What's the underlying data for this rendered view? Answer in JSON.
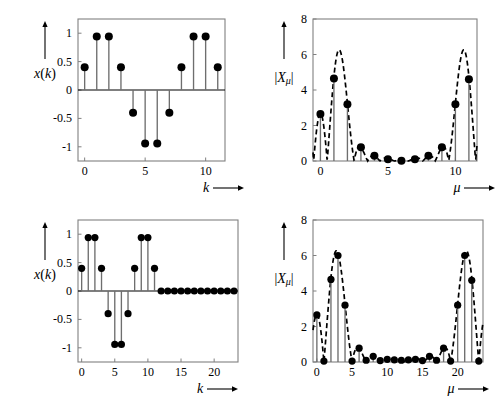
{
  "figure": {
    "background": "#ffffff",
    "ink": "#000000",
    "stem_color": "#6e6e6e",
    "frame_color": "#808080"
  },
  "panels": [
    {
      "id": "top-left",
      "name": "signal-12-point",
      "ylabel": "x(k)",
      "xlabel": "k",
      "xlabel_arrow": "⟶",
      "yticks": [
        "1",
        "0.5",
        "0",
        "-0.5",
        "-1"
      ],
      "ytickvals": [
        1,
        0.5,
        0,
        -0.5,
        -1
      ],
      "xticks": [
        "0",
        "5",
        "10"
      ],
      "xtickvals": [
        0,
        5,
        10
      ]
    },
    {
      "id": "top-right",
      "name": "dft-12-point",
      "ylabel": "|Xμ|",
      "xlabel": "μ",
      "xlabel_arrow": "⟶",
      "yticks": [
        "8",
        "6",
        "4",
        "2",
        "0"
      ],
      "ytickvals": [
        8,
        6,
        4,
        2,
        0
      ],
      "xticks": [
        "0",
        "5",
        "10"
      ],
      "xtickvals": [
        0,
        5,
        10
      ]
    },
    {
      "id": "bottom-left",
      "name": "signal-24-point-zero-padded",
      "ylabel": "x(k)",
      "xlabel": "k",
      "xlabel_arrow": "⟶",
      "yticks": [
        "1",
        "0.5",
        "0",
        "-0.5",
        "-1"
      ],
      "ytickvals": [
        1,
        0.5,
        0,
        -0.5,
        -1
      ],
      "xticks": [
        "0",
        "5",
        "10",
        "15",
        "20"
      ],
      "xtickvals": [
        0,
        5,
        10,
        15,
        20
      ]
    },
    {
      "id": "bottom-right",
      "name": "dft-24-point-zero-padded",
      "ylabel": "|Xμ|",
      "xlabel": "μ",
      "xlabel_arrow": "⟶",
      "yticks": [
        "8",
        "6",
        "4",
        "2",
        "0"
      ],
      "ytickvals": [
        8,
        6,
        4,
        2,
        0
      ],
      "xticks": [
        "0",
        "5",
        "10",
        "15",
        "20"
      ],
      "xtickvals": [
        0,
        5,
        10,
        15,
        20
      ]
    }
  ],
  "chart_data": [
    {
      "type": "line",
      "subtype": "stem",
      "id": "top-left",
      "title": "",
      "xlabel": "k",
      "ylabel": "x(k)",
      "xlim": [
        -0.55,
        11.6
      ],
      "ylim": [
        -1.25,
        1.25
      ],
      "grid": false,
      "legend": null,
      "x": [
        0,
        1,
        2,
        3,
        4,
        5,
        6,
        7,
        8,
        9,
        10,
        11
      ],
      "values": [
        0.4,
        0.94,
        0.94,
        0.4,
        -0.4,
        -0.94,
        -0.94,
        -0.4,
        0.4,
        0.94,
        0.94,
        0.4
      ]
    },
    {
      "type": "line",
      "subtype": "stem-with-dashed-envelope",
      "id": "top-right",
      "title": "",
      "xlabel": "μ",
      "ylabel": "|Xμ|",
      "xlim": [
        -0.55,
        11.6
      ],
      "ylim": [
        0,
        8
      ],
      "grid": false,
      "legend": null,
      "x": [
        0,
        1,
        2,
        3,
        4,
        5,
        6,
        7,
        8,
        9,
        10,
        11
      ],
      "values": [
        2.65,
        4.65,
        3.2,
        0.78,
        0.3,
        0.1,
        0.02,
        0.1,
        0.3,
        0.78,
        3.2,
        4.6
      ],
      "envelope_note": "dashed continuous DTFT magnitude envelope peaking near 6 at μ≈1.3 and μ≈10.7"
    },
    {
      "type": "line",
      "subtype": "stem",
      "id": "bottom-left",
      "title": "",
      "xlabel": "k",
      "ylabel": "x(k)",
      "xlim": [
        -0.55,
        23.6
      ],
      "ylim": [
        -1.25,
        1.25
      ],
      "grid": false,
      "legend": null,
      "x": [
        0,
        1,
        2,
        3,
        4,
        5,
        6,
        7,
        8,
        9,
        10,
        11,
        12,
        13,
        14,
        15,
        16,
        17,
        18,
        19,
        20,
        21,
        22,
        23
      ],
      "values": [
        0.4,
        0.94,
        0.94,
        0.4,
        -0.4,
        -0.94,
        -0.94,
        -0.4,
        0.4,
        0.94,
        0.94,
        0.4,
        0,
        0,
        0,
        0,
        0,
        0,
        0,
        0,
        0,
        0,
        0,
        0
      ]
    },
    {
      "type": "line",
      "subtype": "stem-with-dashed-envelope",
      "id": "bottom-right",
      "title": "",
      "xlabel": "μ",
      "ylabel": "|Xμ|",
      "xlim": [
        -0.55,
        23.6
      ],
      "ylim": [
        0,
        8
      ],
      "grid": false,
      "legend": null,
      "x": [
        0,
        1,
        2,
        3,
        4,
        5,
        6,
        7,
        8,
        9,
        10,
        11,
        12,
        13,
        14,
        15,
        16,
        17,
        18,
        19,
        20,
        21,
        22,
        23
      ],
      "values": [
        2.65,
        0.05,
        4.65,
        6.0,
        3.2,
        0.05,
        0.78,
        0.1,
        0.32,
        0.08,
        0.15,
        0.12,
        0.1,
        0.12,
        0.15,
        0.08,
        0.32,
        0.1,
        0.78,
        0.05,
        3.2,
        6.0,
        4.6,
        0.05
      ],
      "envelope_note": "dashed continuous DTFT magnitude envelope, same shape as top-right but sampled twice as finely"
    }
  ]
}
